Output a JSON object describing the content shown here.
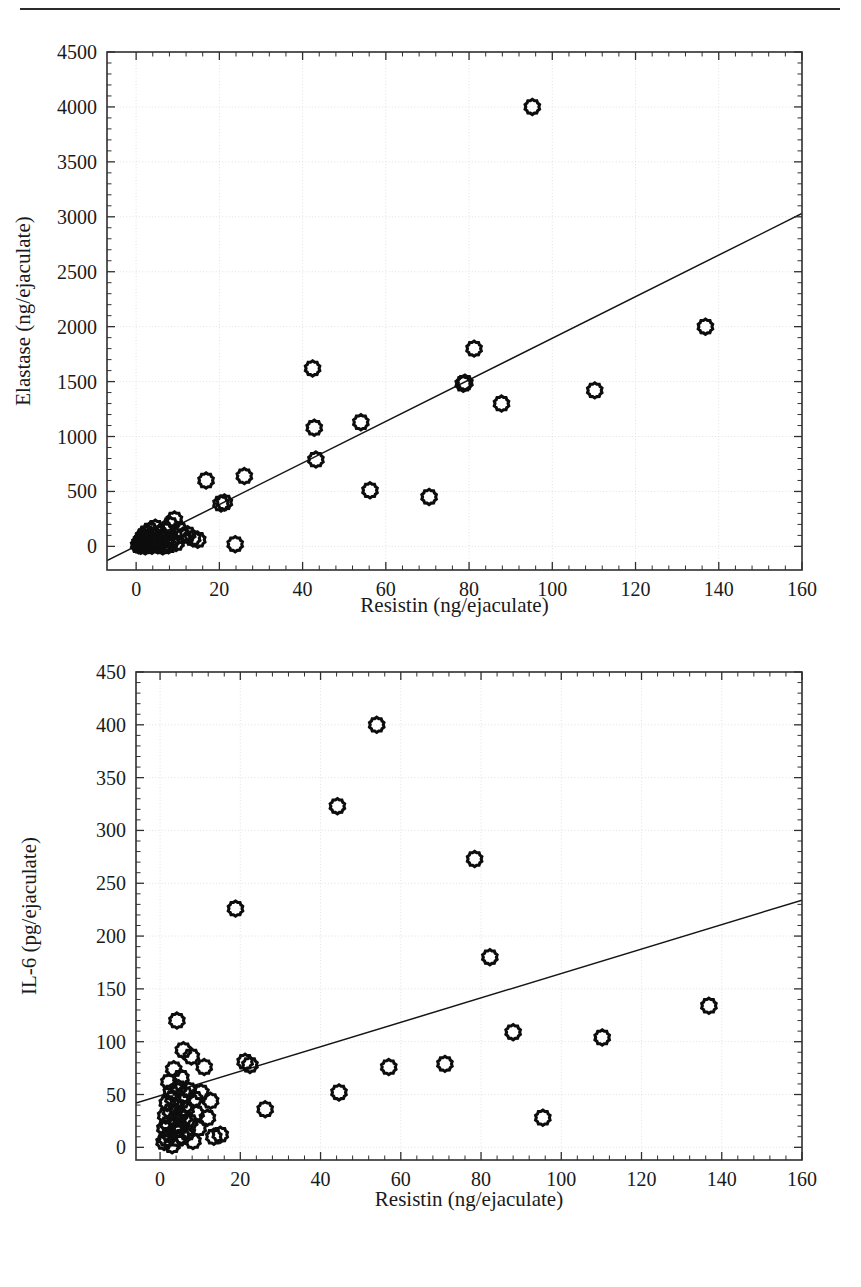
{
  "page": {
    "top_rule": "horizontal-rule"
  },
  "figures": [
    {
      "id": "elastase",
      "xlabel": "Resistin (ng/ejaculate)",
      "ylabel": "Elastase (ng/ejaculate)"
    },
    {
      "id": "il6",
      "xlabel": "Resistin (ng/ejaculate)",
      "ylabel": "IL-6 (pg/ejaculate)"
    }
  ],
  "chart_data": [
    {
      "type": "scatter",
      "title": "",
      "xlabel": "Resistin (ng/ejaculate)",
      "ylabel": "Elastase (ng/ejaculate)",
      "xlim": [
        -7,
        160
      ],
      "ylim": [
        -215,
        4500
      ],
      "xticks": [
        0,
        20,
        40,
        60,
        80,
        100,
        120,
        140,
        160
      ],
      "yticks": [
        0,
        500,
        1000,
        1500,
        2000,
        2500,
        3000,
        3500,
        4000,
        4500
      ],
      "xtick_labels": [
        "0",
        "20",
        "40",
        "60",
        "80",
        "100",
        "120",
        "140",
        "160"
      ],
      "ytick_labels": [
        "0",
        "500",
        "1000",
        "1500",
        "2000",
        "2500",
        "3000",
        "3500",
        "4000",
        "4500"
      ],
      "grid": true,
      "legend": null,
      "marker": "open-circle",
      "points": [
        [
          0.6,
          10
        ],
        [
          0.9,
          35
        ],
        [
          1.1,
          5
        ],
        [
          1.3,
          60
        ],
        [
          1.5,
          20
        ],
        [
          1.8,
          95
        ],
        [
          2.0,
          45
        ],
        [
          2.2,
          0
        ],
        [
          2.4,
          120
        ],
        [
          2.6,
          30
        ],
        [
          2.9,
          75
        ],
        [
          3.1,
          15
        ],
        [
          3.3,
          145
        ],
        [
          3.6,
          55
        ],
        [
          3.8,
          5
        ],
        [
          4.1,
          100
        ],
        [
          4.3,
          35
        ],
        [
          4.6,
          170
        ],
        [
          4.9,
          60
        ],
        [
          5.2,
          10
        ],
        [
          5.5,
          120
        ],
        [
          5.8,
          40
        ],
        [
          6.1,
          85
        ],
        [
          6.4,
          0
        ],
        [
          6.8,
          145
        ],
        [
          7.1,
          25
        ],
        [
          7.4,
          65
        ],
        [
          7.8,
          10
        ],
        [
          8.2,
          195
        ],
        [
          8.6,
          55
        ],
        [
          9.2,
          245
        ],
        [
          9.6,
          30
        ],
        [
          10.4,
          150
        ],
        [
          11.2,
          95
        ],
        [
          12.4,
          110
        ],
        [
          13.6,
          75
        ],
        [
          14.8,
          60
        ],
        [
          16.8,
          600
        ],
        [
          20.4,
          390
        ],
        [
          21.2,
          400
        ],
        [
          23.8,
          20
        ],
        [
          26.0,
          640
        ],
        [
          42.4,
          1620
        ],
        [
          42.8,
          1080
        ],
        [
          43.2,
          790
        ],
        [
          54.0,
          1130
        ],
        [
          56.2,
          510
        ],
        [
          70.4,
          450
        ],
        [
          78.6,
          1480
        ],
        [
          79.0,
          1490
        ],
        [
          81.2,
          1800
        ],
        [
          87.8,
          1300
        ],
        [
          95.2,
          4000
        ],
        [
          110.2,
          1420
        ],
        [
          136.8,
          2000
        ]
      ],
      "trend_line": {
        "type": "linear-fit",
        "x_start": -7,
        "y_start": -130,
        "x_end": 160,
        "y_end": 3030
      }
    },
    {
      "type": "scatter",
      "title": "",
      "xlabel": "Resistin (ng/ejaculate)",
      "ylabel": "IL-6 (pg/ejaculate)",
      "xlim": [
        -6,
        160
      ],
      "ylim": [
        -12,
        450
      ],
      "xticks": [
        0,
        20,
        40,
        60,
        80,
        100,
        120,
        140,
        160
      ],
      "yticks": [
        0,
        50,
        100,
        150,
        200,
        250,
        300,
        350,
        400,
        450
      ],
      "xtick_labels": [
        "0",
        "20",
        "40",
        "60",
        "80",
        "100",
        "120",
        "140",
        "160"
      ],
      "ytick_labels": [
        "0",
        "50",
        "100",
        "150",
        "200",
        "250",
        "300",
        "350",
        "400",
        "450"
      ],
      "grid": true,
      "legend": null,
      "marker": "open-circle",
      "points": [
        [
          1.0,
          5
        ],
        [
          1.2,
          18
        ],
        [
          1.4,
          30
        ],
        [
          1.6,
          8
        ],
        [
          1.8,
          42
        ],
        [
          2.0,
          22
        ],
        [
          2.2,
          62
        ],
        [
          2.4,
          12
        ],
        [
          2.6,
          34
        ],
        [
          2.8,
          52
        ],
        [
          3.0,
          2
        ],
        [
          3.2,
          46
        ],
        [
          3.4,
          74
        ],
        [
          3.6,
          26
        ],
        [
          3.8,
          16
        ],
        [
          4.0,
          38
        ],
        [
          4.2,
          120
        ],
        [
          4.4,
          8
        ],
        [
          4.6,
          56
        ],
        [
          4.8,
          30
        ],
        [
          5.0,
          20
        ],
        [
          5.2,
          66
        ],
        [
          5.4,
          44
        ],
        [
          5.6,
          10
        ],
        [
          5.8,
          92
        ],
        [
          6.0,
          28
        ],
        [
          6.2,
          50
        ],
        [
          6.5,
          36
        ],
        [
          6.8,
          14
        ],
        [
          7.1,
          54
        ],
        [
          7.4,
          24
        ],
        [
          7.8,
          86
        ],
        [
          8.2,
          6
        ],
        [
          8.6,
          46
        ],
        [
          9.0,
          32
        ],
        [
          9.5,
          18
        ],
        [
          10.2,
          52
        ],
        [
          11.0,
          76
        ],
        [
          11.8,
          28
        ],
        [
          12.6,
          44
        ],
        [
          13.4,
          10
        ],
        [
          15.0,
          12
        ],
        [
          18.8,
          226
        ],
        [
          21.2,
          81
        ],
        [
          22.4,
          78
        ],
        [
          26.2,
          36
        ],
        [
          44.2,
          323
        ],
        [
          44.6,
          52
        ],
        [
          54.0,
          400
        ],
        [
          57.0,
          76
        ],
        [
          71.0,
          79
        ],
        [
          78.4,
          273
        ],
        [
          82.2,
          180
        ],
        [
          88.0,
          109
        ],
        [
          95.4,
          28
        ],
        [
          110.2,
          104
        ],
        [
          136.8,
          134
        ]
      ],
      "trend_line": {
        "type": "linear-fit",
        "x_start": -6,
        "y_start": 42,
        "x_end": 160,
        "y_end": 234
      }
    }
  ]
}
